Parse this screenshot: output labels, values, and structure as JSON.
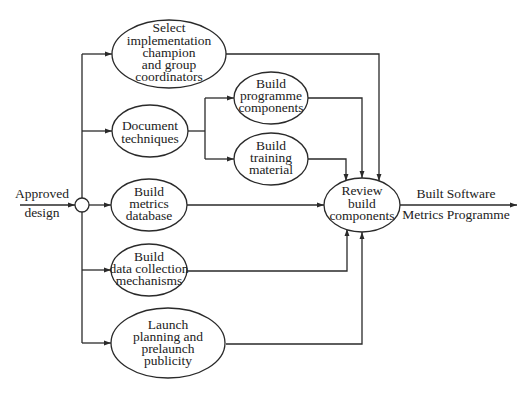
{
  "diagram": {
    "type": "process-flow",
    "colors": {
      "line": "#2a2a2a",
      "text": "#222222",
      "background": "#ffffff"
    },
    "input": {
      "line1": "Approved",
      "line2": "design"
    },
    "output": {
      "line1": "Built Software",
      "line2": "Metrics Programme"
    },
    "nodes": {
      "select": {
        "lines": [
          "Select",
          "implementation",
          "champion",
          "and group",
          "coordinators"
        ]
      },
      "document": {
        "lines": [
          "Document",
          "techniques"
        ]
      },
      "programme": {
        "lines": [
          "Build",
          "programme",
          "components"
        ]
      },
      "training": {
        "lines": [
          "Build",
          "training",
          "material"
        ]
      },
      "metrics": {
        "lines": [
          "Build",
          "metrics",
          "database"
        ]
      },
      "datacollection": {
        "lines": [
          "Build",
          "data collection",
          "mechanisms"
        ]
      },
      "launch": {
        "lines": [
          "Launch",
          "planning and",
          "prelaunch",
          "publicity"
        ]
      },
      "review": {
        "lines": [
          "Review",
          "build",
          "components"
        ]
      }
    },
    "edges": [
      {
        "from": "Approved design",
        "to": "junction"
      },
      {
        "from": "junction",
        "to": "Select implementation champion and group coordinators"
      },
      {
        "from": "junction",
        "to": "Document techniques"
      },
      {
        "from": "junction",
        "to": "Build metrics database"
      },
      {
        "from": "junction",
        "to": "Build data collection mechanisms"
      },
      {
        "from": "junction",
        "to": "Launch planning and prelaunch publicity"
      },
      {
        "from": "Document techniques",
        "to": "Build programme components"
      },
      {
        "from": "Document techniques",
        "to": "Build training material"
      },
      {
        "from": "Select implementation champion and group coordinators",
        "to": "Review build components"
      },
      {
        "from": "Build programme components",
        "to": "Review build components"
      },
      {
        "from": "Build training material",
        "to": "Review build components"
      },
      {
        "from": "Build metrics database",
        "to": "Review build components"
      },
      {
        "from": "Build data collection mechanisms",
        "to": "Review build components"
      },
      {
        "from": "Launch planning and prelaunch publicity",
        "to": "Review build components"
      },
      {
        "from": "Review build components",
        "to": "Built Software Metrics Programme"
      }
    ]
  }
}
